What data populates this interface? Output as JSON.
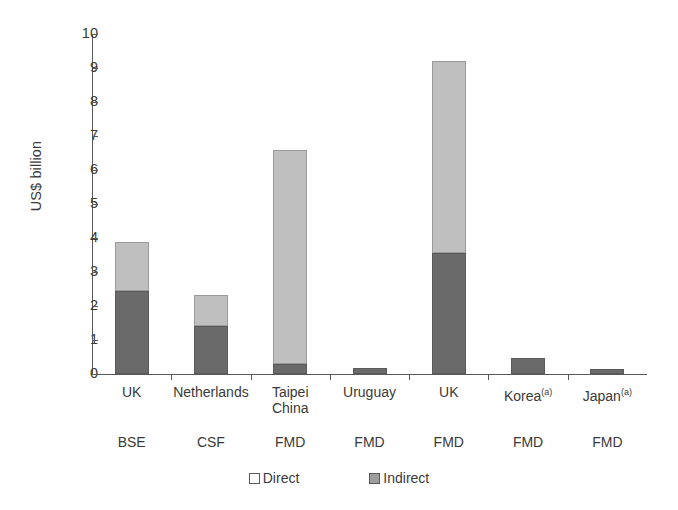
{
  "chart_data": {
    "type": "bar",
    "stacked": true,
    "title": "",
    "xlabel": "",
    "ylabel": "US$ billion",
    "ylim": [
      0,
      10
    ],
    "yticks": [
      0,
      1,
      2,
      3,
      4,
      5,
      6,
      7,
      8,
      9,
      10
    ],
    "ytick_labels": [
      "0",
      "1",
      "2",
      "3",
      "4",
      "5",
      "6",
      "7",
      "8",
      "9",
      "10"
    ],
    "grid": false,
    "legend_position": "bottom-center",
    "categories": [
      "UK",
      "Netherlands",
      "Taipei China",
      "Uruguay",
      "UK",
      "Korea(a)",
      "Japan(a)"
    ],
    "category_lines": [
      [
        "UK"
      ],
      [
        "Netherlands"
      ],
      [
        "Taipei",
        "China"
      ],
      [
        "Uruguay"
      ],
      [
        "UK"
      ],
      [
        "Korea",
        "(a)"
      ],
      [
        "Japan",
        "(a)"
      ]
    ],
    "group_labels": [
      "BSE",
      "CSF",
      "FMD",
      "FMD",
      "FMD",
      "FMD",
      "FMD"
    ],
    "series": [
      {
        "name": "Direct",
        "color": "#6a6a6a",
        "values": [
          2.45,
          1.4,
          0.3,
          0.17,
          3.57,
          0.48,
          0.15
        ]
      },
      {
        "name": "Indirect",
        "color": "#bfbfbf",
        "values": [
          1.43,
          0.92,
          6.3,
          0.0,
          5.63,
          0.0,
          0.0
        ]
      }
    ],
    "totals": [
      3.88,
      2.32,
      6.6,
      0.17,
      9.2,
      0.48,
      0.15
    ]
  },
  "legend": {
    "items": [
      {
        "label": "Direct",
        "swatch": "legend-swatch-direct"
      },
      {
        "label": "Indirect",
        "swatch": "legend-swatch-indirect"
      }
    ]
  },
  "axes": {
    "y_title": "US$ billion"
  }
}
